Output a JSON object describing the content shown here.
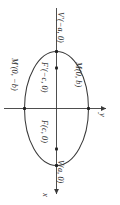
{
  "figure": {
    "type": "ellipse-diagram",
    "orientation_note": "figure rotated 90 degrees; all text reads sideways",
    "background_color": "#ffffff",
    "stroke_color": "#3a3a3a",
    "text_color": "#2b2b2b"
  },
  "axes": {
    "horizontal": {
      "label": "y",
      "direction": "right",
      "arrow": true
    },
    "vertical": {
      "label": "x",
      "direction": "down",
      "arrow": true
    },
    "origin_label": ""
  },
  "curve": {
    "shape": "ellipse",
    "center": [
      0,
      0
    ],
    "semi_major_axis": "a",
    "semi_minor_axis": "b",
    "focal_distance": "c",
    "major_axis": "vertical (x-axis of figure)"
  },
  "points": [
    {
      "id": "vertex-upper",
      "label": "V'(−a, 0)",
      "kind": "vertex",
      "marker": true
    },
    {
      "id": "vertex-lower",
      "label": "V(a, 0)",
      "kind": "vertex",
      "marker": true
    },
    {
      "id": "focus-upper",
      "label": "F'(−c, 0)",
      "kind": "focus",
      "marker": true
    },
    {
      "id": "focus-lower",
      "label": "F(c, 0)",
      "kind": "focus",
      "marker": true
    },
    {
      "id": "covertex-right",
      "label": "M(0, b)",
      "kind": "co-vertex",
      "marker": true
    },
    {
      "id": "covertex-left",
      "label": "M'(0, −b)",
      "kind": "co-vertex",
      "marker": true
    }
  ]
}
